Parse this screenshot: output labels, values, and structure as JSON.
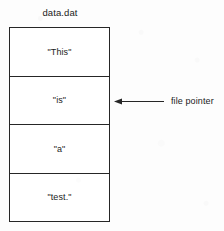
{
  "diagram": {
    "title": "data.dat",
    "cells": [
      {
        "label": "\"This\""
      },
      {
        "label": "\"is\""
      },
      {
        "label": "\"a\""
      },
      {
        "label": "\"test.\""
      }
    ],
    "annotation": {
      "label": "file pointer",
      "arrow_icon": "arrow-left-icon",
      "points_to_cell_index": 1
    },
    "colors": {
      "background": "#fdfdfd",
      "box_fill": "#ffffff",
      "stroke": "#262626",
      "text": "#1b1b1b"
    }
  }
}
